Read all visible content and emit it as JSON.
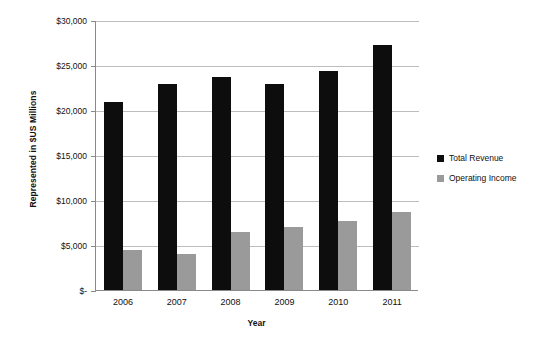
{
  "chart_data": {
    "type": "bar",
    "title": "",
    "xlabel": "Year",
    "ylabel": "Represented in $US Millions",
    "categories": [
      "2006",
      "2007",
      "2008",
      "2009",
      "2010",
      "2011"
    ],
    "series": [
      {
        "name": "Total Revenue",
        "color": "#0d0d0d",
        "values": [
          20900,
          22850,
          23700,
          22900,
          24300,
          27200
        ]
      },
      {
        "name": "Operating Income",
        "color": "#9a9a9a",
        "values": [
          4450,
          4000,
          6500,
          7000,
          7700,
          8700
        ]
      }
    ],
    "ylim": [
      0,
      30000
    ],
    "ytick_values": [
      0,
      5000,
      10000,
      15000,
      20000,
      25000,
      30000
    ],
    "ytick_labels": [
      "$-",
      "$5,000",
      "$10,000",
      "$15,000",
      "$20,000",
      "$25,000",
      "$30,000"
    ],
    "grid": true,
    "legend_position": "right"
  },
  "legend": {
    "entries": [
      {
        "label": "Total Revenue",
        "swatch": "black-square-icon"
      },
      {
        "label": "Operating Income",
        "swatch": "gray-square-icon"
      }
    ]
  }
}
